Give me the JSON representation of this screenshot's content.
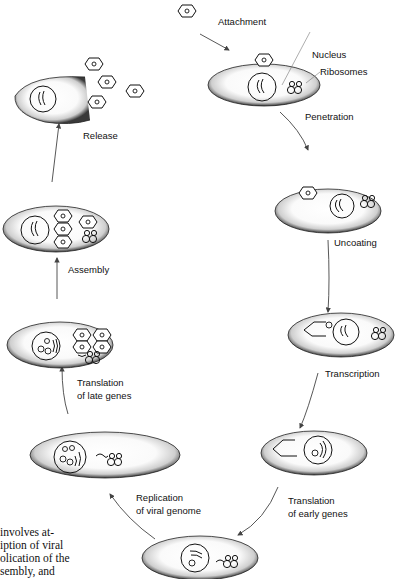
{
  "diagram": {
    "stages": [
      {
        "id": "attachment",
        "label": "Attachment"
      },
      {
        "id": "penetration",
        "label": "Penetration"
      },
      {
        "id": "uncoating",
        "label": "Uncoating"
      },
      {
        "id": "transcription",
        "label": "Transcription"
      },
      {
        "id": "translation-early",
        "label_line1": "Translation",
        "label_line2": "of early genes"
      },
      {
        "id": "replication",
        "label_line1": "Replication",
        "label_line2": "of viral genome"
      },
      {
        "id": "translation-late",
        "label_line1": "Translation",
        "label_line2": "of late genes"
      },
      {
        "id": "assembly",
        "label": "Assembly"
      },
      {
        "id": "release",
        "label": "Release"
      }
    ],
    "annotations": {
      "nucleus": "Nucleus",
      "ribosomes": "Ribosomes"
    },
    "caption_lines": [
      "involves at-",
      "iption of viral",
      "olication of the",
      "sembly, and"
    ],
    "colors": {
      "ink": "#111111",
      "cell_shade": "#555555",
      "arrow": "#444444",
      "background": "#ffffff"
    }
  }
}
